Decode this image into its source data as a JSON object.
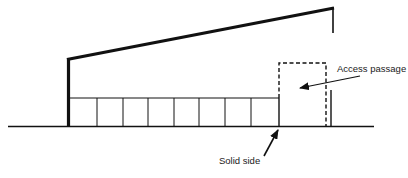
{
  "diagram": {
    "type": "shelter cross-section",
    "colors": {
      "stroke": "#111111",
      "background": "#ffffff"
    },
    "labels": {
      "access_passage": "Access passage",
      "solid_side": "Solid side"
    },
    "components": [
      "ground-line",
      "roof-line",
      "rear-post",
      "front-post",
      "pen-partitions",
      "access-passage-outline",
      "access-passage-arrow",
      "solid-side-arrow"
    ],
    "partition_count": 8
  }
}
